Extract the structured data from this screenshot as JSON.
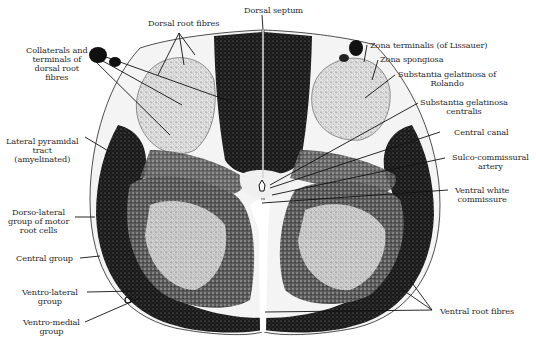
{
  "figure": {
    "colors": {
      "background": "#ffffff",
      "ink": "#111111",
      "label_text": "#2a2a2a",
      "white_matter": "#f2f2f2",
      "gray_matter_light": "#d8d8d8"
    }
  },
  "labels": {
    "dorsal_septum": "Dorsal septum",
    "dorsal_root_fibres": "Dorsal root fibres",
    "collaterals": "Collaterals and\nterminals of\ndorsal root\nfibres",
    "zona_terminalis": "Zona terminalis (of Lissauer)",
    "zona_spongiosa": "Zona spongiosa",
    "sg_rolando": "Substantia gelatinosa of\nRolando",
    "sg_centralis": "Substantia gelatinosa\ncentralis",
    "central_canal": "Central canal",
    "sulco_commissural": "Sulco-commissural\nartery",
    "ventral_white_commissure": "Ventral white\ncommissure",
    "lateral_pyramidal": "Lateral pyramidal\ntract\n(amyelinated)",
    "dorso_lateral": "Dorso-lateral\ngroup of motor\nroot cells",
    "central_group": "Central group",
    "ventro_lateral": "Ventro-lateral\ngroup",
    "ventro_medial": "Ventro-medial\ngroup",
    "ventral_root_fibres": "Ventral root fibres"
  }
}
